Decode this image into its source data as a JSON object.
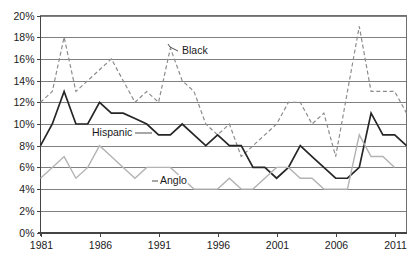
{
  "chart_data": {
    "type": "line",
    "title": "",
    "subtitle": "",
    "xlabel": "",
    "ylabel": "",
    "xlim": [
      1981,
      2012
    ],
    "ylim": [
      0,
      20
    ],
    "grid": true,
    "legend_position": "inline-annotations",
    "x": [
      1981,
      1982,
      1983,
      1984,
      1985,
      1986,
      1987,
      1988,
      1989,
      1990,
      1991,
      1992,
      1993,
      1994,
      1995,
      1996,
      1997,
      1998,
      1999,
      2000,
      2001,
      2002,
      2003,
      2004,
      2005,
      2006,
      2007,
      2008,
      2009,
      2010,
      2011,
      2012
    ],
    "x_tick_labels": [
      "1981",
      "1986",
      "1991",
      "1996",
      "2001",
      "2006",
      "2011"
    ],
    "x_tick_values": [
      1981,
      1986,
      1991,
      1996,
      2001,
      2006,
      2011
    ],
    "y_tick_labels": [
      "0%",
      "2%",
      "4%",
      "6%",
      "8%",
      "10%",
      "12%",
      "14%",
      "16%",
      "18%",
      "20%"
    ],
    "y_tick_values": [
      0,
      2,
      4,
      6,
      8,
      10,
      12,
      14,
      16,
      18,
      20
    ],
    "series": [
      {
        "name": "Black",
        "style": "dashed",
        "color": "#8c8c8c",
        "values": [
          12,
          13,
          18,
          13,
          14,
          15,
          16,
          14,
          12,
          13,
          12,
          17,
          14,
          13,
          10,
          9,
          10,
          7,
          8,
          9,
          10,
          12,
          12,
          10,
          11,
          7,
          13,
          19,
          13,
          13,
          13,
          11
        ]
      },
      {
        "name": "Hispanic",
        "style": "solid",
        "color": "#262626",
        "values": [
          8,
          10,
          13,
          10,
          10,
          12,
          11,
          11,
          10.5,
          10,
          9,
          9,
          10,
          9,
          8,
          9,
          8,
          8,
          6,
          6,
          5,
          6,
          8,
          7,
          6,
          5,
          5,
          6,
          11,
          9,
          9,
          8
        ]
      },
      {
        "name": "Anglo",
        "style": "solid",
        "color": "#b3b3b3",
        "values": [
          5,
          6,
          7,
          5,
          6,
          8,
          7,
          6,
          5,
          6,
          6,
          6,
          5,
          4,
          4,
          4,
          5,
          4,
          4,
          5,
          6,
          6,
          5,
          5,
          4,
          4,
          4,
          9,
          7,
          7,
          6,
          null
        ]
      }
    ],
    "annotations": [
      {
        "text": "Black",
        "series": "Black",
        "anchor_year": 1992,
        "anchor_value": 17
      },
      {
        "text": "Hispanic",
        "series": "Hispanic",
        "anchor_year": 1992,
        "anchor_value": 9
      },
      {
        "text": "Anglo",
        "series": "Anglo",
        "anchor_year": 1995,
        "anchor_value": 6
      }
    ],
    "colors": {
      "black_series": "#8c8c8c",
      "hispanic_series": "#262626",
      "anglo_series": "#b3b3b3",
      "gridline": "#808080",
      "plot_border": "#6e6e6e",
      "text": "#1a1a1a",
      "background": "#ffffff"
    }
  }
}
